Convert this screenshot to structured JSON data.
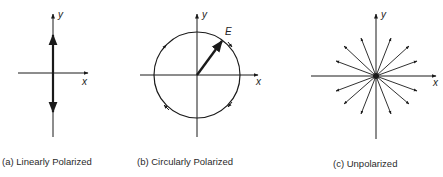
{
  "panels": [
    {
      "id": "a",
      "caption": "(a)  Linearly Polarized",
      "x_label": "x",
      "y_label": "y"
    },
    {
      "id": "b",
      "caption": "(b)  Circularly Polarized",
      "x_label": "x",
      "y_label": "y",
      "vector_label": "E"
    },
    {
      "id": "c",
      "caption": "(c)  Unpolarized",
      "x_label": "x",
      "y_label": "y"
    }
  ],
  "colors": {
    "ink": "#1a1a1a",
    "background": "#ffffff"
  }
}
